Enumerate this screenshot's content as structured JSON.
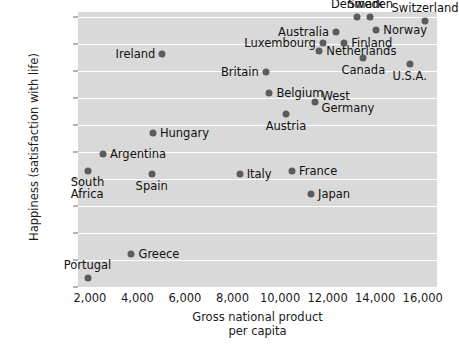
{
  "chart_data": {
    "type": "scatter",
    "title": "",
    "xlabel": "Gross national product\nper capita",
    "xlabel_line1": "Gross national product",
    "xlabel_line2": "per capita",
    "ylabel": "Happiness (satisfaction with life)",
    "xlim": [
      1500,
      16600
    ],
    "ylim": [
      5.5,
      8.05
    ],
    "xticks": [
      2000,
      4000,
      6000,
      8000,
      10000,
      12000,
      14000,
      16000
    ],
    "xtick_labels": [
      "2,000",
      "4,000",
      "6,000",
      "8,000",
      "10,000",
      "12,000",
      "14,000",
      "16,000"
    ],
    "yticks": [
      5.5,
      5.75,
      6.0,
      6.25,
      6.5,
      6.75,
      7.0,
      7.25,
      7.5,
      7.75,
      8.0
    ],
    "ytick_labels": [
      "5.5",
      "5.75",
      "6.0",
      "6.25",
      "6.5",
      "6.75",
      "7.0",
      "7.25",
      "7.5",
      "7.75",
      "8.0"
    ],
    "grid": true,
    "grid_color": "#ffffff",
    "plot_bg": "#d9d9d9",
    "marker_color": "#5c5c5c",
    "legend": null,
    "points": [
      {
        "label": "Switzerland",
        "x": 16100,
        "y": 7.97,
        "label_pos": "above"
      },
      {
        "label": "Sweden",
        "x": 13800,
        "y": 8.0,
        "label_pos": "above"
      },
      {
        "label": "Denmark",
        "x": 13250,
        "y": 8.0,
        "label_pos": "above"
      },
      {
        "label": "Norway",
        "x": 14050,
        "y": 7.88,
        "label_pos": "right"
      },
      {
        "label": "Australia",
        "x": 12350,
        "y": 7.86,
        "label_pos": "left"
      },
      {
        "label": "Finland",
        "x": 12700,
        "y": 7.76,
        "label_pos": "right"
      },
      {
        "label": "Luxembourg",
        "x": 11800,
        "y": 7.76,
        "label_pos": "left"
      },
      {
        "label": "Netherlands",
        "x": 11650,
        "y": 7.69,
        "label_pos": "right"
      },
      {
        "label": "Ireland",
        "x": 5050,
        "y": 7.66,
        "label_pos": "left"
      },
      {
        "label": "Canada",
        "x": 13500,
        "y": 7.62,
        "label_pos": "below"
      },
      {
        "label": "U.S.A.",
        "x": 15450,
        "y": 7.57,
        "label_pos": "below"
      },
      {
        "label": "Britain",
        "x": 9400,
        "y": 7.49,
        "label_pos": "left"
      },
      {
        "label": "Belgium",
        "x": 9550,
        "y": 7.3,
        "label_pos": "right"
      },
      {
        "label": "West Germany",
        "x": 11450,
        "y": 7.22,
        "label_pos": "right"
      },
      {
        "label": "Austria",
        "x": 10250,
        "y": 7.1,
        "label_pos": "below"
      },
      {
        "label": "Hungary",
        "x": 4650,
        "y": 6.93,
        "label_pos": "right"
      },
      {
        "label": "Argentina",
        "x": 2550,
        "y": 6.73,
        "label_pos": "right"
      },
      {
        "label": "France",
        "x": 10500,
        "y": 6.58,
        "label_pos": "right"
      },
      {
        "label": "South Africa",
        "x": 1900,
        "y": 6.58,
        "label_pos": "below"
      },
      {
        "label": "Italy",
        "x": 8300,
        "y": 6.55,
        "label_pos": "right"
      },
      {
        "label": "Spain",
        "x": 4600,
        "y": 6.55,
        "label_pos": "below"
      },
      {
        "label": "Japan",
        "x": 11300,
        "y": 6.36,
        "label_pos": "right"
      },
      {
        "label": "Greece",
        "x": 3750,
        "y": 5.81,
        "label_pos": "right"
      },
      {
        "label": "Portugal",
        "x": 1900,
        "y": 5.58,
        "label_pos": "above"
      }
    ]
  }
}
